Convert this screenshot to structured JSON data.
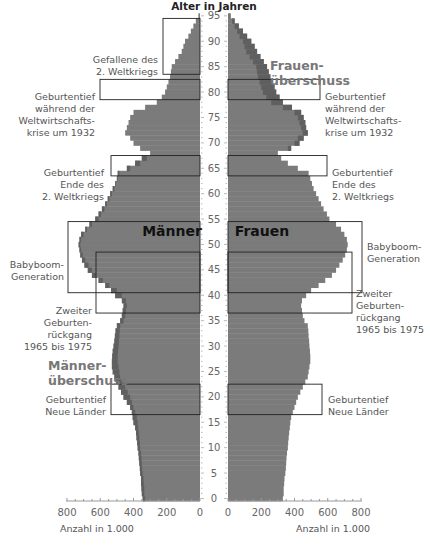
{
  "chart_data": {
    "type": "bar",
    "subtype": "population-pyramid",
    "title": "Alter in Jahren",
    "ylabel": "Alter in Jahren",
    "xlabel_left": "Anzahl in 1.000",
    "xlabel_right": "Anzahl in 1.000",
    "x_ticks_left": [
      "800",
      "600",
      "400",
      "200",
      "0"
    ],
    "x_ticks_right": [
      "0",
      "200",
      "400",
      "600",
      "800"
    ],
    "y_ticks": [
      "0",
      "5",
      "10",
      "15",
      "20",
      "25",
      "30",
      "35",
      "40",
      "45",
      "50",
      "55",
      "60",
      "65",
      "70",
      "75",
      "80",
      "85",
      "90",
      "95"
    ],
    "xlim": [
      0,
      800
    ],
    "ylim": [
      0,
      95
    ],
    "grid": false,
    "categories": [
      0,
      1,
      2,
      3,
      4,
      5,
      6,
      7,
      8,
      9,
      10,
      11,
      12,
      13,
      14,
      15,
      16,
      17,
      18,
      19,
      20,
      21,
      22,
      23,
      24,
      25,
      26,
      27,
      28,
      29,
      30,
      31,
      32,
      33,
      34,
      35,
      36,
      37,
      38,
      39,
      40,
      41,
      42,
      43,
      44,
      45,
      46,
      47,
      48,
      49,
      50,
      51,
      52,
      53,
      54,
      55,
      56,
      57,
      58,
      59,
      60,
      61,
      62,
      63,
      64,
      65,
      66,
      67,
      68,
      69,
      70,
      71,
      72,
      73,
      74,
      75,
      76,
      77,
      78,
      79,
      80,
      81,
      82,
      83,
      84,
      85,
      86,
      87,
      88,
      89,
      90,
      91,
      92,
      93,
      94,
      95
    ],
    "series": [
      {
        "name": "Männer",
        "side": "left",
        "values": [
          345,
          350,
          352,
          355,
          355,
          360,
          362,
          365,
          368,
          370,
          375,
          378,
          382,
          385,
          390,
          400,
          405,
          410,
          420,
          440,
          460,
          475,
          490,
          505,
          515,
          525,
          530,
          530,
          528,
          525,
          520,
          515,
          512,
          508,
          500,
          480,
          470,
          465,
          460,
          470,
          510,
          535,
          570,
          610,
          650,
          675,
          695,
          710,
          720,
          725,
          730,
          725,
          715,
          690,
          665,
          630,
          610,
          590,
          570,
          555,
          540,
          525,
          510,
          500,
          495,
          440,
          390,
          350,
          300,
          360,
          400,
          420,
          450,
          440,
          430,
          420,
          400,
          330,
          260,
          230,
          210,
          200,
          190,
          180,
          175,
          170,
          150,
          130,
          110,
          100,
          90,
          70,
          55,
          40,
          25,
          10
        ]
      },
      {
        "name": "Frauen",
        "side": "right",
        "values": [
          330,
          335,
          335,
          338,
          340,
          345,
          348,
          350,
          352,
          355,
          360,
          362,
          365,
          368,
          372,
          375,
          380,
          390,
          400,
          410,
          420,
          435,
          450,
          465,
          480,
          485,
          490,
          495,
          495,
          493,
          490,
          488,
          485,
          483,
          480,
          460,
          450,
          445,
          440,
          445,
          470,
          500,
          545,
          585,
          625,
          650,
          670,
          690,
          705,
          715,
          720,
          715,
          700,
          680,
          650,
          610,
          595,
          575,
          560,
          545,
          530,
          515,
          505,
          495,
          485,
          420,
          360,
          320,
          300,
          380,
          430,
          455,
          480,
          470,
          465,
          455,
          440,
          385,
          330,
          310,
          290,
          280,
          270,
          255,
          245,
          235,
          215,
          195,
          175,
          160,
          140,
          115,
          90,
          65,
          40,
          15
        ]
      }
    ],
    "annotations": [
      {
        "text": "Gefallene des 2. Weltkriegs",
        "side": "left",
        "age_range": [
          84,
          95
        ]
      },
      {
        "text": "Geburtentief während der Weltwirtschafts-krise um 1932",
        "side": "both",
        "age_range": [
          79,
          83
        ]
      },
      {
        "text": "Geburtentief Ende des 2. Weltkriegs",
        "side": "both",
        "age_range": [
          64,
          68
        ]
      },
      {
        "text": "Babyboom-Generation",
        "side": "both",
        "age_range": [
          41,
          54
        ]
      },
      {
        "text": "Zweiter Geburten-rückgang 1965 bis 1975",
        "side": "both",
        "age_range": [
          37,
          48
        ]
      },
      {
        "text": "Geburtentief Neue Länder",
        "side": "both",
        "age_range": [
          17,
          22
        ]
      }
    ],
    "labels": {
      "men": "Männer",
      "women": "Frauen",
      "men_surplus": "Männer-überschuss",
      "women_surplus": "Frauen-überschuss"
    },
    "colors": {
      "bar": "#7b7b7b",
      "surplus": "#5f5f5f",
      "box": "#222222",
      "text": "#555555"
    }
  },
  "labels": {
    "title": "Alter in Jahren",
    "men": "Männer",
    "women": "Frauen",
    "men_surplus_1": "Männer-",
    "men_surplus_2": "überschuss",
    "women_surplus_1": "Frauen-",
    "women_surplus_2": "überschuss",
    "axis_left": "Anzahl in 1.000",
    "axis_right": "Anzahl in 1.000",
    "ann_ww2_dead_1": "Gefallene des",
    "ann_ww2_dead_2": "2. Weltkriegs",
    "ann_1932_1": "Geburtentief",
    "ann_1932_2": "während der",
    "ann_1932_3": "Weltwirtschafts-",
    "ann_1932_4": "krise um 1932",
    "ann_ww2end_1": "Geburtentief",
    "ann_ww2end_2": "Ende des",
    "ann_ww2end_3": "2. Weltkriegs",
    "ann_babyboom_1": "Babyboom-",
    "ann_babyboom_2": "Generation",
    "ann_second_1": "Zweiter",
    "ann_second_2": "Geburten-",
    "ann_second_3": "rückgang",
    "ann_second_4": "1965 bis 1975",
    "ann_neue_1": "Geburtentief",
    "ann_neue_2": "Neue Länder"
  }
}
